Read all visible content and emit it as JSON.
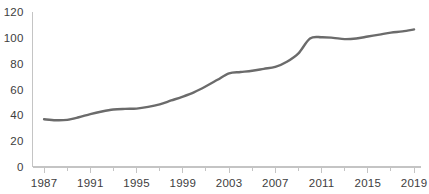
{
  "chart_data": {
    "type": "line",
    "title": "",
    "subtitle": "",
    "xlabel": "",
    "ylabel": "",
    "xlim": [
      1986,
      2019.6
    ],
    "ylim": [
      0,
      120
    ],
    "grid": false,
    "legend": null,
    "line_color": "#6b6b6b",
    "axis_color": "#c4c4c4",
    "text_color": "#3d3d3d",
    "background_color": "#ffffff",
    "y_ticks": [
      0,
      20,
      40,
      60,
      80,
      100,
      120
    ],
    "y_tick_labels": [
      "0",
      "20",
      "40",
      "60",
      "80",
      "100",
      "120"
    ],
    "x_ticks": [
      1987,
      1989,
      1991,
      1993,
      1995,
      1997,
      1999,
      2001,
      2003,
      2005,
      2007,
      2009,
      2011,
      2013,
      2015,
      2017,
      2019
    ],
    "x_tick_labels_major": [
      "1987",
      "1991",
      "1995",
      "1999",
      "2003",
      "2007",
      "2011",
      "2015",
      "2019"
    ],
    "x_major_ticks": [
      1987,
      1991,
      1995,
      1999,
      2003,
      2007,
      2011,
      2015,
      2019
    ],
    "x_minor_ticks": [
      1989,
      1993,
      1997,
      2001,
      2005,
      2009,
      2013,
      2017
    ],
    "series": [
      {
        "name": "series-1",
        "color": "#6b6b6b",
        "x": [
          1987,
          1988,
          1989,
          1990,
          1991,
          1992,
          1993,
          1994,
          1995,
          1996,
          1997,
          1998,
          1999,
          2000,
          2001,
          2002,
          2003,
          2004,
          2005,
          2006,
          2007,
          2008,
          2009,
          2010,
          2011,
          2012,
          2013,
          2014,
          2015,
          2016,
          2017,
          2018,
          2019
        ],
        "values": [
          37,
          36.2,
          36.5,
          38.5,
          41,
          43,
          44.5,
          45,
          45.2,
          46.5,
          48.5,
          51.5,
          54.5,
          58,
          62.5,
          67.5,
          72.5,
          73.5,
          74.5,
          76,
          77.5,
          81.5,
          88,
          99.5,
          100.5,
          100,
          99,
          99.5,
          101,
          102.5,
          104,
          105,
          106.5
        ]
      }
    ]
  }
}
